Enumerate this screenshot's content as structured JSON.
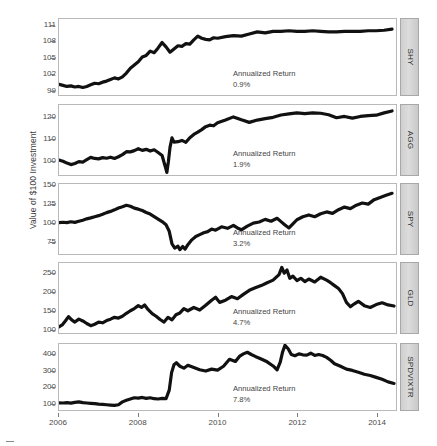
{
  "chart_data": {
    "type": "line",
    "title": "",
    "subtitle": "",
    "xlabel": "",
    "ylabel": "Value of $100 Investment",
    "grid": false,
    "legend": false,
    "layout": "5 stacked trellis panels, shared x axis, strip labels on right",
    "x": [
      2006,
      2014.5
    ],
    "xticks": [
      "2006",
      "2008",
      "2010",
      "2012",
      "2014"
    ],
    "xtickvalues": [
      2006,
      2008,
      2010,
      2012,
      2014
    ],
    "panels": [
      {
        "name": "SHY",
        "strip_label": "SHY",
        "annotation_label": "Annualized Return",
        "annotation_value": "0.9%",
        "ylim": [
          98.0,
          112.2
        ],
        "yticks": [
          "111",
          "108",
          "105",
          "102",
          "99"
        ],
        "ytickvalues": [
          111,
          108,
          105,
          102,
          99
        ],
        "series": [
          {
            "name": "SHY",
            "x": [
              2006.0,
              2006.1,
              2006.2,
              2006.3,
              2006.4,
              2006.5,
              2006.6,
              2006.7,
              2006.8,
              2006.9,
              2007.0,
              2007.1,
              2007.2,
              2007.3,
              2007.4,
              2007.5,
              2007.6,
              2007.7,
              2007.8,
              2007.9,
              2008.0,
              2008.1,
              2008.2,
              2008.3,
              2008.4,
              2008.5,
              2008.6,
              2008.7,
              2008.8,
              2008.9,
              2009.0,
              2009.1,
              2009.2,
              2009.3,
              2009.4,
              2009.5,
              2009.6,
              2009.7,
              2009.8,
              2009.9,
              2010.0,
              2010.2,
              2010.4,
              2010.6,
              2010.8,
              2011.0,
              2011.2,
              2011.4,
              2011.6,
              2011.8,
              2012.0,
              2012.2,
              2012.4,
              2012.6,
              2012.8,
              2013.0,
              2013.2,
              2013.4,
              2013.6,
              2013.8,
              2014.0,
              2014.2,
              2014.4
            ],
            "y": [
              100.0,
              99.8,
              99.6,
              99.7,
              99.5,
              99.6,
              99.4,
              99.6,
              99.9,
              100.2,
              100.1,
              100.4,
              100.6,
              100.9,
              101.2,
              101.0,
              101.4,
              102.1,
              103.0,
              103.6,
              104.2,
              105.1,
              105.4,
              106.2,
              105.9,
              106.8,
              107.8,
              107.0,
              106.0,
              106.6,
              107.2,
              107.1,
              107.6,
              107.5,
              108.3,
              109.0,
              108.6,
              108.4,
              108.3,
              108.7,
              108.6,
              108.9,
              109.1,
              109.0,
              109.4,
              109.8,
              109.6,
              109.9,
              109.9,
              110.0,
              109.9,
              109.9,
              110.0,
              109.9,
              109.8,
              109.8,
              109.9,
              109.9,
              109.9,
              110.0,
              110.0,
              110.1,
              110.3
            ]
          }
        ]
      },
      {
        "name": "AGG",
        "strip_label": "AGG",
        "annotation_label": "Annualized Return",
        "annotation_value": "1.9%",
        "ylim": [
          93.0,
          126.0
        ],
        "yticks": [
          "120",
          "110",
          "100"
        ],
        "ytickvalues": [
          120,
          110,
          100
        ],
        "series": [
          {
            "name": "AGG",
            "x": [
              2006.0,
              2006.1,
              2006.2,
              2006.3,
              2006.4,
              2006.5,
              2006.6,
              2006.7,
              2006.8,
              2006.9,
              2007.0,
              2007.1,
              2007.2,
              2007.3,
              2007.4,
              2007.5,
              2007.6,
              2007.7,
              2007.8,
              2007.9,
              2008.0,
              2008.1,
              2008.2,
              2008.3,
              2008.4,
              2008.5,
              2008.6,
              2008.68,
              2008.72,
              2008.76,
              2008.8,
              2008.85,
              2008.9,
              2009.0,
              2009.1,
              2009.2,
              2009.3,
              2009.4,
              2009.5,
              2009.6,
              2009.7,
              2009.8,
              2009.9,
              2010.0,
              2010.2,
              2010.4,
              2010.6,
              2010.8,
              2011.0,
              2011.2,
              2011.4,
              2011.6,
              2011.8,
              2012.0,
              2012.2,
              2012.4,
              2012.6,
              2012.8,
              2013.0,
              2013.2,
              2013.4,
              2013.6,
              2013.8,
              2014.0,
              2014.2,
              2014.4
            ],
            "y": [
              100.0,
              99.5,
              98.6,
              97.9,
              98.4,
              99.3,
              99.1,
              100.2,
              101.3,
              100.8,
              100.6,
              101.2,
              100.9,
              101.4,
              100.8,
              101.6,
              102.6,
              104.0,
              103.9,
              104.5,
              105.4,
              104.6,
              105.1,
              104.3,
              104.9,
              103.6,
              102.2,
              97.0,
              94.2,
              99.5,
              106.0,
              110.5,
              108.5,
              108.7,
              109.3,
              108.4,
              110.6,
              112.1,
              113.2,
              114.4,
              115.8,
              116.5,
              116.2,
              117.6,
              118.9,
              120.4,
              119.0,
              117.8,
              118.9,
              119.6,
              120.2,
              121.3,
              121.8,
              122.3,
              121.9,
              122.3,
              122.1,
              121.4,
              120.0,
              120.6,
              119.8,
              120.6,
              121.0,
              121.2,
              122.3,
              123.2
            ]
          }
        ]
      },
      {
        "name": "SPY",
        "strip_label": "SPY",
        "annotation_label": "Annualized Return",
        "annotation_value": "3.2%",
        "ylim": [
          58.0,
          152.0
        ],
        "yticks": [
          "150",
          "125",
          "100",
          "75"
        ],
        "ytickvalues": [
          150,
          125,
          100,
          75
        ],
        "series": [
          {
            "name": "SPY",
            "x": [
              2006.0,
              2006.1,
              2006.2,
              2006.3,
              2006.4,
              2006.5,
              2006.6,
              2006.7,
              2006.8,
              2006.9,
              2007.0,
              2007.1,
              2007.2,
              2007.3,
              2007.4,
              2007.5,
              2007.6,
              2007.7,
              2007.8,
              2007.9,
              2008.0,
              2008.1,
              2008.2,
              2008.3,
              2008.4,
              2008.5,
              2008.6,
              2008.7,
              2008.78,
              2008.85,
              2008.92,
              2009.0,
              2009.05,
              2009.12,
              2009.18,
              2009.25,
              2009.35,
              2009.45,
              2009.55,
              2009.65,
              2009.75,
              2009.85,
              2009.95,
              2010.1,
              2010.25,
              2010.4,
              2010.5,
              2010.6,
              2010.75,
              2010.9,
              2011.05,
              2011.2,
              2011.35,
              2011.5,
              2011.6,
              2011.7,
              2011.8,
              2011.9,
              2012.0,
              2012.15,
              2012.3,
              2012.45,
              2012.6,
              2012.75,
              2012.9,
              2013.05,
              2013.2,
              2013.35,
              2013.5,
              2013.65,
              2013.8,
              2013.95,
              2014.1,
              2014.25,
              2014.4
            ],
            "y": [
              100.0,
              100.6,
              100.2,
              101.3,
              100.5,
              101.9,
              103.4,
              105.2,
              106.5,
              108.1,
              109.5,
              111.3,
              113.6,
              115.2,
              117.3,
              119.8,
              121.5,
              123.4,
              122.1,
              119.6,
              118.2,
              116.4,
              113.8,
              111.6,
              108.3,
              104.9,
              101.5,
              97.2,
              88.5,
              71.5,
              66.0,
              68.5,
              63.8,
              68.0,
              64.5,
              70.5,
              77.0,
              81.5,
              84.0,
              86.5,
              88.0,
              91.5,
              90.0,
              94.5,
              92.5,
              96.5,
              93.0,
              90.5,
              95.5,
              99.5,
              101.0,
              104.5,
              102.0,
              106.0,
              101.5,
              97.0,
              93.0,
              98.5,
              104.0,
              108.0,
              110.5,
              108.0,
              112.0,
              114.5,
              112.5,
              117.5,
              121.0,
              119.0,
              123.5,
              126.5,
              125.0,
              131.0,
              134.0,
              137.0,
              139.5
            ]
          }
        ]
      },
      {
        "name": "GLD",
        "strip_label": "GLD",
        "annotation_label": "Annualized Return",
        "annotation_value": "4.7%",
        "ylim": [
          88.0,
          280.0
        ],
        "yticks": [
          "250",
          "200",
          "150",
          "100"
        ],
        "ytickvalues": [
          250,
          200,
          150,
          100
        ],
        "series": [
          {
            "name": "GLD",
            "x": [
              2006.0,
              2006.08,
              2006.16,
              2006.24,
              2006.32,
              2006.4,
              2006.5,
              2006.6,
              2006.7,
              2006.8,
              2006.9,
              2007.0,
              2007.1,
              2007.2,
              2007.3,
              2007.4,
              2007.5,
              2007.6,
              2007.7,
              2007.8,
              2007.9,
              2008.0,
              2008.08,
              2008.16,
              2008.25,
              2008.35,
              2008.45,
              2008.55,
              2008.65,
              2008.75,
              2008.85,
              2008.95,
              2009.05,
              2009.15,
              2009.25,
              2009.4,
              2009.55,
              2009.7,
              2009.85,
              2009.95,
              2010.05,
              2010.2,
              2010.35,
              2010.5,
              2010.65,
              2010.8,
              2010.95,
              2011.1,
              2011.25,
              2011.4,
              2011.55,
              2011.62,
              2011.68,
              2011.75,
              2011.82,
              2011.9,
              2012.0,
              2012.1,
              2012.2,
              2012.3,
              2012.45,
              2012.6,
              2012.75,
              2012.85,
              2012.95,
              2013.05,
              2013.15,
              2013.25,
              2013.35,
              2013.45,
              2013.55,
              2013.7,
              2013.85,
              2014.0,
              2014.15,
              2014.3,
              2014.45
            ],
            "y": [
              105.0,
              110.0,
              121.0,
              133.0,
              124.0,
              118.0,
              126.0,
              121.0,
              114.0,
              108.0,
              112.0,
              118.0,
              116.0,
              122.0,
              126.0,
              131.0,
              129.0,
              134.0,
              142.0,
              149.0,
              155.0,
              163.0,
              158.0,
              165.0,
              152.0,
              141.0,
              134.0,
              125.0,
              118.0,
              131.0,
              124.0,
              138.0,
              143.0,
              155.0,
              149.0,
              158.0,
              151.0,
              164.0,
              178.0,
              186.0,
              172.0,
              178.0,
              188.0,
              182.0,
              194.0,
              205.0,
              212.0,
              218.0,
              226.0,
              233.0,
              248.0,
              268.0,
              252.0,
              261.0,
              238.0,
              244.0,
              232.0,
              238.0,
              229.0,
              236.0,
              228.0,
              241.0,
              233.0,
              226.0,
              218.0,
              210.0,
              196.0,
              172.0,
              160.0,
              168.0,
              175.0,
              163.0,
              158.0,
              166.0,
              171.0,
              165.0,
              162.0
            ]
          }
        ]
      },
      {
        "name": "SPDVIXTR",
        "strip_label": "SPDVIXTR",
        "annotation_label": "Annualized Return",
        "annotation_value": "7.8%",
        "ylim": [
          55.0,
          470.0
        ],
        "yticks": [
          "400",
          "300",
          "200",
          "100"
        ],
        "ytickvalues": [
          400,
          300,
          200,
          100
        ],
        "series": [
          {
            "name": "SPDVIXTR",
            "x": [
              2006.0,
              2006.1,
              2006.2,
              2006.3,
              2006.4,
              2006.5,
              2006.6,
              2006.7,
              2006.8,
              2006.9,
              2007.0,
              2007.1,
              2007.2,
              2007.3,
              2007.4,
              2007.5,
              2007.6,
              2007.7,
              2007.8,
              2007.9,
              2008.0,
              2008.1,
              2008.2,
              2008.3,
              2008.4,
              2008.5,
              2008.6,
              2008.7,
              2008.78,
              2008.84,
              2008.9,
              2008.96,
              2009.05,
              2009.15,
              2009.25,
              2009.4,
              2009.55,
              2009.7,
              2009.85,
              2010.0,
              2010.15,
              2010.3,
              2010.45,
              2010.55,
              2010.65,
              2010.75,
              2010.85,
              2010.95,
              2011.1,
              2011.25,
              2011.4,
              2011.5,
              2011.58,
              2011.64,
              2011.7,
              2011.78,
              2011.86,
              2011.95,
              2012.05,
              2012.15,
              2012.25,
              2012.35,
              2012.45,
              2012.55,
              2012.65,
              2012.75,
              2012.85,
              2012.95,
              2013.1,
              2013.25,
              2013.4,
              2013.55,
              2013.7,
              2013.85,
              2014.0,
              2014.15,
              2014.3,
              2014.45
            ],
            "y": [
              100.0,
              99.0,
              101.0,
              98.0,
              103.0,
              106.0,
              101.0,
              99.0,
              97.0,
              95.0,
              92.0,
              90.0,
              88.0,
              86.0,
              84.0,
              88.0,
              106.0,
              116.0,
              124.0,
              132.0,
              130.0,
              134.0,
              128.0,
              132.0,
              126.0,
              124.0,
              128.0,
              126.0,
              180.0,
              290.0,
              340.0,
              352.0,
              330.0,
              318.0,
              336.0,
              322.0,
              308.0,
              300.0,
              312.0,
              306.0,
              330.0,
              374.0,
              360.0,
              392.0,
              408.0,
              418.0,
              404.0,
              392.0,
              376.0,
              358.0,
              332.0,
              308.0,
              356.0,
              420.0,
              462.0,
              440.0,
              404.0,
              396.0,
              408.0,
              402.0,
              400.0,
              412.0,
              398.0,
              404.0,
              398.0,
              386.0,
              368.0,
              346.0,
              330.0,
              312.0,
              304.0,
              292.0,
              280.0,
              272.0,
              260.0,
              248.0,
              232.0,
              222.0
            ]
          }
        ]
      }
    ]
  }
}
